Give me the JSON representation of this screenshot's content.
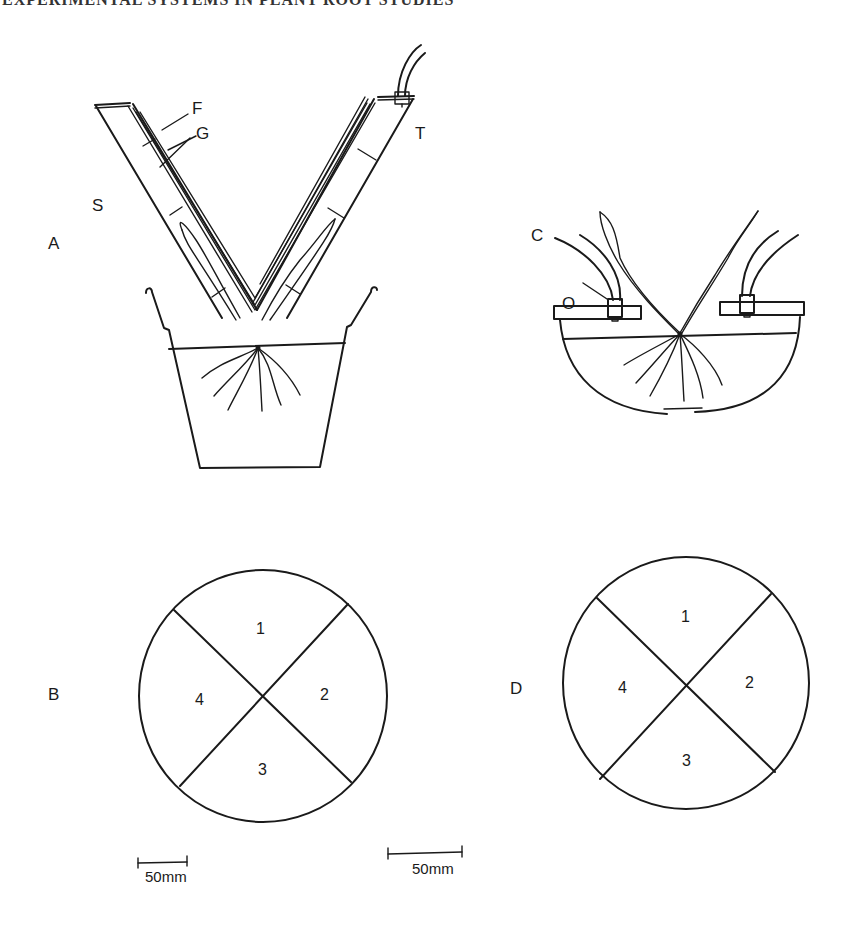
{
  "header": {
    "text": "EXPERIMENTAL SYSTEMS IN PLANT ROOT STUDIES"
  },
  "panels": {
    "A": {
      "label": "A",
      "callouts": {
        "F": "F",
        "G": "G",
        "S": "S",
        "T": "T"
      }
    },
    "B": {
      "label": "B",
      "sectors": [
        "1",
        "2",
        "3",
        "4"
      ],
      "scale_bar": "50mm"
    },
    "C": {
      "label": "C",
      "callouts": {
        "O": "O"
      }
    },
    "D": {
      "label": "D",
      "sectors": [
        "1",
        "2",
        "3",
        "4"
      ],
      "scale_bar": "50mm"
    }
  },
  "colors": {
    "ink": "#1a1a1a",
    "background": "#ffffff"
  }
}
